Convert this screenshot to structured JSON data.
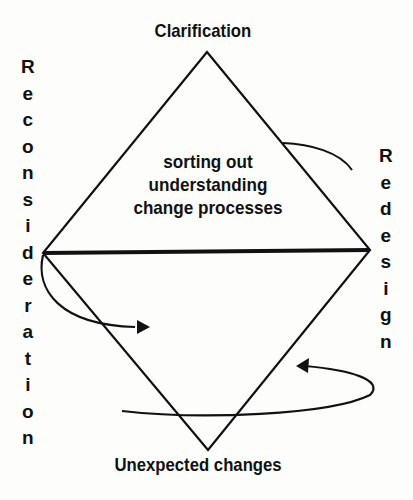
{
  "diagram": {
    "top_label": "Clarification",
    "bottom_label": "Unexpected changes",
    "left_label": "Reconsideration",
    "right_label": "Redesign",
    "center_lines": [
      "sorting out",
      "understanding",
      "change processes"
    ],
    "left_letters": [
      "R",
      "e",
      "c",
      "o",
      "n",
      "s",
      "i",
      "d",
      "e",
      "r",
      "a",
      "t",
      "i",
      "o",
      "n"
    ],
    "right_letters": [
      "R",
      "e",
      "d",
      "e",
      "s",
      "i",
      "g",
      "n"
    ]
  }
}
